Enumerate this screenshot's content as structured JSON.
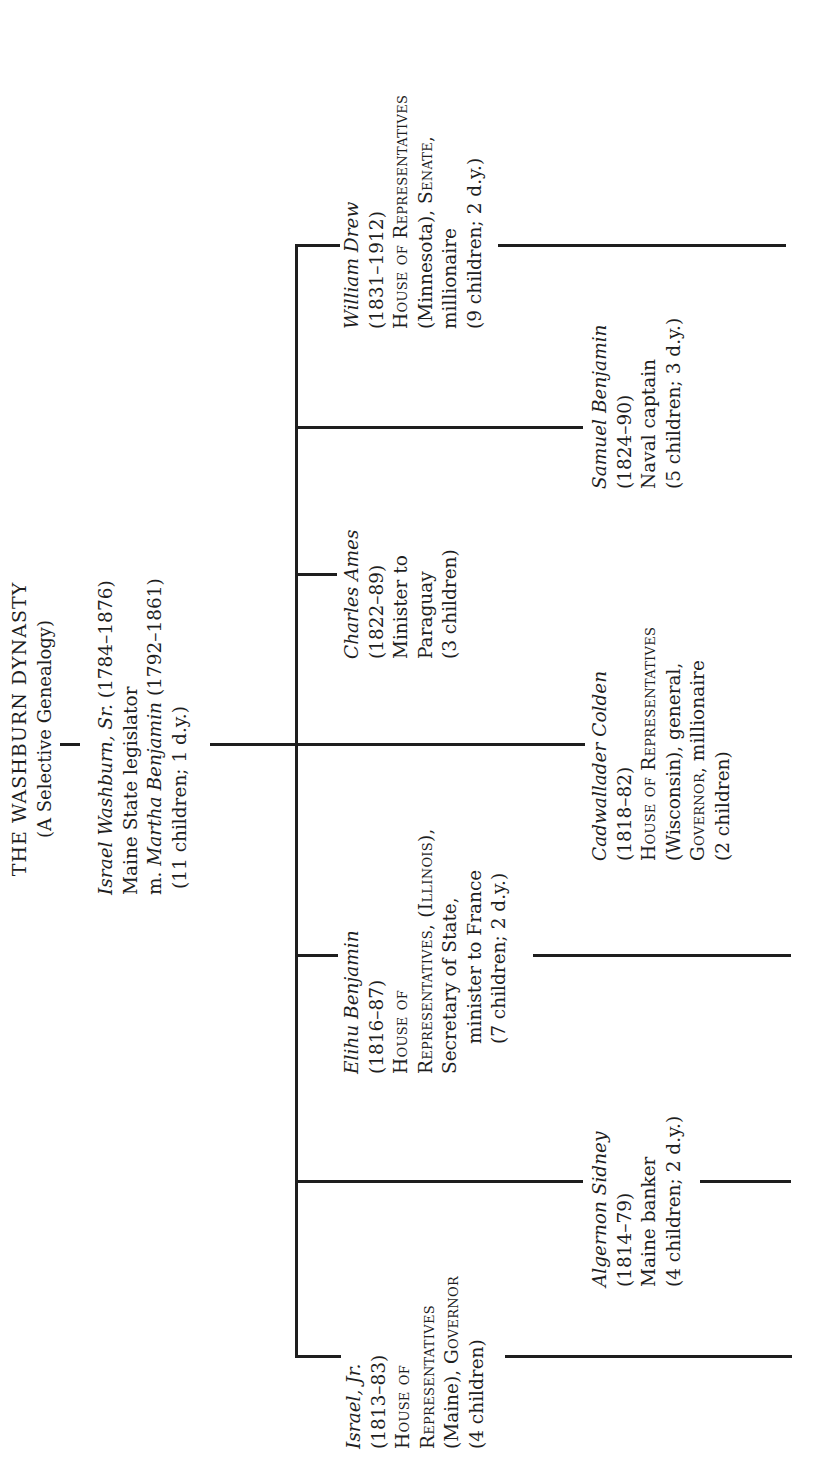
{
  "title": {
    "main": "THE WASHBURN DYNASTY",
    "subtitle": "(A Selective Genealogy)"
  },
  "parent": {
    "name": "Israel Washburn, Sr.",
    "dates": " (1784–1876)",
    "role": "Maine State legislator",
    "spouse_prefix": "m. ",
    "spouse_name": "Martha Benjamin",
    "spouse_dates": " (1792–1861)",
    "children": "(11 children; 1 d.y.)"
  },
  "children": [
    {
      "name": "Israel, Jr.",
      "dates": "(1813–83)",
      "lines": [
        "House of",
        "Representatives",
        "(Maine), ",
        "Governor",
        "(4 children)"
      ]
    },
    {
      "name": "Algernon Sidney",
      "dates": "(1814–79)",
      "lines": [
        "Maine banker",
        "(4 children; 2 d.y.)"
      ]
    },
    {
      "name": "Elihu Benjamin",
      "dates": "(1816–87)",
      "lines": [
        "House of",
        "Representatives, (Illinois),",
        "Secretary of State,",
        "minister to France",
        "(7 children; 2 d.y.)"
      ]
    },
    {
      "name": "Cadwallader Colden",
      "dates": "(1818–82)",
      "lines": [
        "House of Representatives",
        "(Wisconsin), general,",
        "Governor",
        ", millionaire",
        "(2 children)"
      ]
    },
    {
      "name": "Charles Ames",
      "dates": "(1822–89)",
      "lines": [
        "Minister to",
        "Paraguay",
        "(3 children)"
      ]
    },
    {
      "name": "Samuel Benjamin",
      "dates": "(1824–90)",
      "lines": [
        "Naval captain",
        "(5 children; 3 d.y.)"
      ]
    },
    {
      "name": "William Drew",
      "dates": "(1831–1912)",
      "lines": [
        "House of Representatives",
        "(Minnesota), ",
        "Senate",
        ",",
        "millionaire",
        "(9 children; 2 d.y.)"
      ]
    }
  ],
  "colors": {
    "ink": "#1e1e1e",
    "paper": "#ffffff"
  }
}
